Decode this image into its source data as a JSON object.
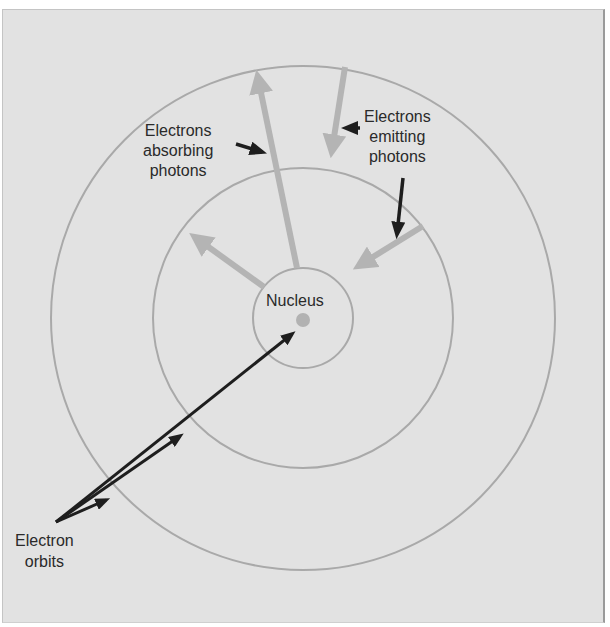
{
  "diagram": {
    "colors": {
      "background": "#e2e2e2",
      "orbit_stroke": "#a9a9a9",
      "transition_arrow": "#b4b4b4",
      "pointer_arrow": "#1e1e1e",
      "nucleus": "#b2b2b2"
    },
    "geometry": {
      "center": [
        303,
        318
      ],
      "orbit_radii": [
        50,
        150,
        252
      ],
      "nucleus_radius": 7
    },
    "labels": {
      "nucleus": "Nucleus",
      "absorbing": {
        "line1": "Electrons",
        "line2": "absorbing",
        "line3": "photons"
      },
      "emitting": {
        "line1": "Electrons",
        "line2": "emitting",
        "line3": "photons"
      },
      "orbits": {
        "line1": "Electron",
        "line2": "orbits"
      }
    },
    "transitions": [
      {
        "type": "absorption",
        "from_orbit": 1,
        "to_orbit": 3
      },
      {
        "type": "absorption",
        "from_orbit": 1,
        "to_orbit": 2
      },
      {
        "type": "emission",
        "from_orbit": 3,
        "to_orbit": 2
      },
      {
        "type": "emission",
        "from_orbit": 2,
        "to_orbit": 1
      }
    ]
  }
}
